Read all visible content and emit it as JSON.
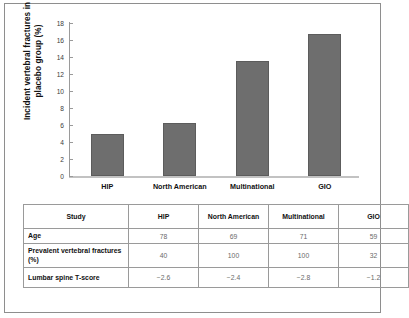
{
  "chart_data": {
    "type": "bar",
    "title": "",
    "xlabel": "",
    "ylabel": "Incident vertebral fractures in placebo group (%)",
    "categories": [
      "HIP",
      "North American",
      "Multinational",
      "GIO"
    ],
    "values": [
      4.9,
      6.2,
      13.5,
      16.7
    ],
    "ylim": [
      0,
      18
    ],
    "yticks": [
      0,
      2,
      4,
      6,
      8,
      10,
      12,
      14,
      16,
      18
    ],
    "grid": false,
    "legend": null,
    "bar_color": "#6e6e6e"
  },
  "table": {
    "headers": [
      "Study",
      "HIP",
      "North American",
      "Multinational",
      "GIO"
    ],
    "rows": [
      {
        "label": "Age",
        "values": [
          "78",
          "69",
          "71",
          "59"
        ]
      },
      {
        "label": "Prevalent vertebral fractures (%)",
        "values": [
          "40",
          "100",
          "100",
          "32"
        ]
      },
      {
        "label": "Lumbar spine T-score",
        "values": [
          "−2.6",
          "−2.4",
          "−2.8",
          "−1.2"
        ]
      }
    ]
  }
}
